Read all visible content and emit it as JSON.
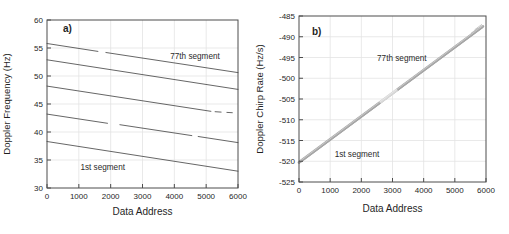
{
  "style": {
    "background": "#ffffff",
    "axis_color": "#4c4c4c",
    "grid_color": "#e3e3e3",
    "text_color": "#1f1f1f",
    "annotation_color": "#2a2a2a"
  },
  "chart_data": [
    {
      "type": "line",
      "panel_label": "a)",
      "xlabel": "Data Address",
      "ylabel": "Doppler Frequency (Hz)",
      "xlim": [
        0,
        6000
      ],
      "ylim": [
        30,
        60
      ],
      "xticks": [
        0,
        1000,
        2000,
        3000,
        4000,
        5000,
        6000
      ],
      "yticks": [
        30,
        35,
        40,
        45,
        50,
        55,
        60
      ],
      "grid": true,
      "legend": "none",
      "line_color": "#3f3f3f",
      "annotations": [
        {
          "text": "77th segment",
          "x": 4650,
          "y": 53.6
        },
        {
          "text": "1st segment",
          "x": 1750,
          "y": 33.8
        }
      ],
      "series": [
        {
          "name": "77th segment track",
          "segments": [
            [
              [
                0,
                55.8
              ],
              [
                1600,
                54.4
              ]
            ],
            [
              [
                1850,
                54.2
              ],
              [
                6000,
                50.6
              ]
            ]
          ]
        },
        {
          "name": "segment track 4",
          "segments": [
            [
              [
                0,
                52.9
              ],
              [
                6000,
                47.6
              ]
            ]
          ]
        },
        {
          "name": "segment track 3",
          "segments": [
            [
              [
                0,
                48.2
              ],
              [
                5150,
                43.7
              ]
            ],
            [
              [
                5280,
                43.62
              ],
              [
                5470,
                43.55
              ]
            ],
            [
              [
                5650,
                43.5
              ],
              [
                5820,
                43.45
              ]
            ]
          ]
        },
        {
          "name": "segment track 2",
          "segments": [
            [
              [
                0,
                43.2
              ],
              [
                1900,
                41.55
              ]
            ],
            [
              [
                2290,
                41.3
              ],
              [
                4550,
                39.35
              ]
            ],
            [
              [
                4750,
                39.2
              ],
              [
                6000,
                38.1
              ]
            ]
          ]
        },
        {
          "name": "1st segment track",
          "segments": [
            [
              [
                0,
                38.3
              ],
              [
                6000,
                33.0
              ]
            ]
          ]
        }
      ]
    },
    {
      "type": "line",
      "panel_label": "b)",
      "xlabel": "Data Address",
      "ylabel": "Doppler Chirp Rate (Hz/s)",
      "xlim": [
        0,
        6000
      ],
      "ylim": [
        -525,
        -485
      ],
      "xticks": [
        0,
        1000,
        2000,
        3000,
        4000,
        5000,
        6000
      ],
      "yticks": [
        -525,
        -520,
        -515,
        -510,
        -505,
        -500,
        -495,
        -490,
        -485
      ],
      "grid": true,
      "legend": "none",
      "band_color": "#a6a6a6",
      "annotations": [
        {
          "text": "77th segment",
          "x": 3300,
          "y": -495.0
        },
        {
          "text": "1st segment",
          "x": 1860,
          "y": -518.3
        }
      ],
      "band": {
        "description": "77 overlapping segment traces forming one thick gray band",
        "num_traces": 77,
        "start": [
          0,
          -520.3
        ],
        "end": [
          5900,
          -487.5
        ],
        "light_patch": {
          "x_start": 2600,
          "x_end": 3150
        },
        "frayed_end": true
      }
    }
  ]
}
